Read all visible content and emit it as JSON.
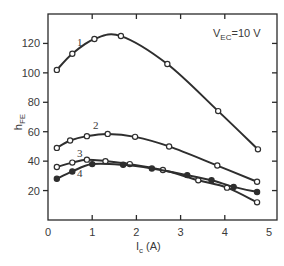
{
  "chart_data": {
    "type": "line",
    "title": "",
    "xlabel": "I",
    "xlabel_sub": "c",
    "xlabel_unit": " (A)",
    "ylabel": "h",
    "ylabel_sub": "FE",
    "xlim": [
      0,
      5
    ],
    "ylim": [
      0,
      140
    ],
    "xticks": [
      0,
      1,
      2,
      3,
      4,
      5
    ],
    "yticks": [
      20,
      40,
      60,
      80,
      100,
      120
    ],
    "grid": false,
    "annotation": {
      "main": "V",
      "sub": "EC",
      "rest": "=10 V"
    },
    "series": [
      {
        "name": "1",
        "marker": "open",
        "points": [
          [
            0.2,
            102
          ],
          [
            0.55,
            113
          ],
          [
            1.05,
            123
          ],
          [
            1.65,
            125
          ],
          [
            2.7,
            106
          ],
          [
            3.85,
            74
          ],
          [
            4.75,
            48
          ]
        ]
      },
      {
        "name": "2",
        "marker": "open",
        "points": [
          [
            0.2,
            49
          ],
          [
            0.5,
            54
          ],
          [
            0.88,
            57
          ],
          [
            1.35,
            58.5
          ],
          [
            1.97,
            56.5
          ],
          [
            2.74,
            50
          ],
          [
            3.83,
            37
          ],
          [
            4.73,
            26
          ]
        ]
      },
      {
        "name": "3",
        "marker": "open",
        "points": [
          [
            0.2,
            36
          ],
          [
            0.55,
            39
          ],
          [
            0.88,
            41
          ],
          [
            1.3,
            40
          ],
          [
            1.85,
            38
          ],
          [
            2.6,
            34
          ],
          [
            3.4,
            27
          ],
          [
            4.05,
            22
          ],
          [
            4.73,
            12
          ]
        ]
      },
      {
        "name": "4",
        "marker": "filled",
        "points": [
          [
            0.2,
            28
          ],
          [
            0.55,
            33
          ],
          [
            1.0,
            38
          ],
          [
            1.7,
            37.5
          ],
          [
            2.35,
            35
          ],
          [
            3.15,
            30.5
          ],
          [
            3.7,
            27
          ],
          [
            4.2,
            22.5
          ],
          [
            4.73,
            19
          ]
        ]
      }
    ]
  }
}
